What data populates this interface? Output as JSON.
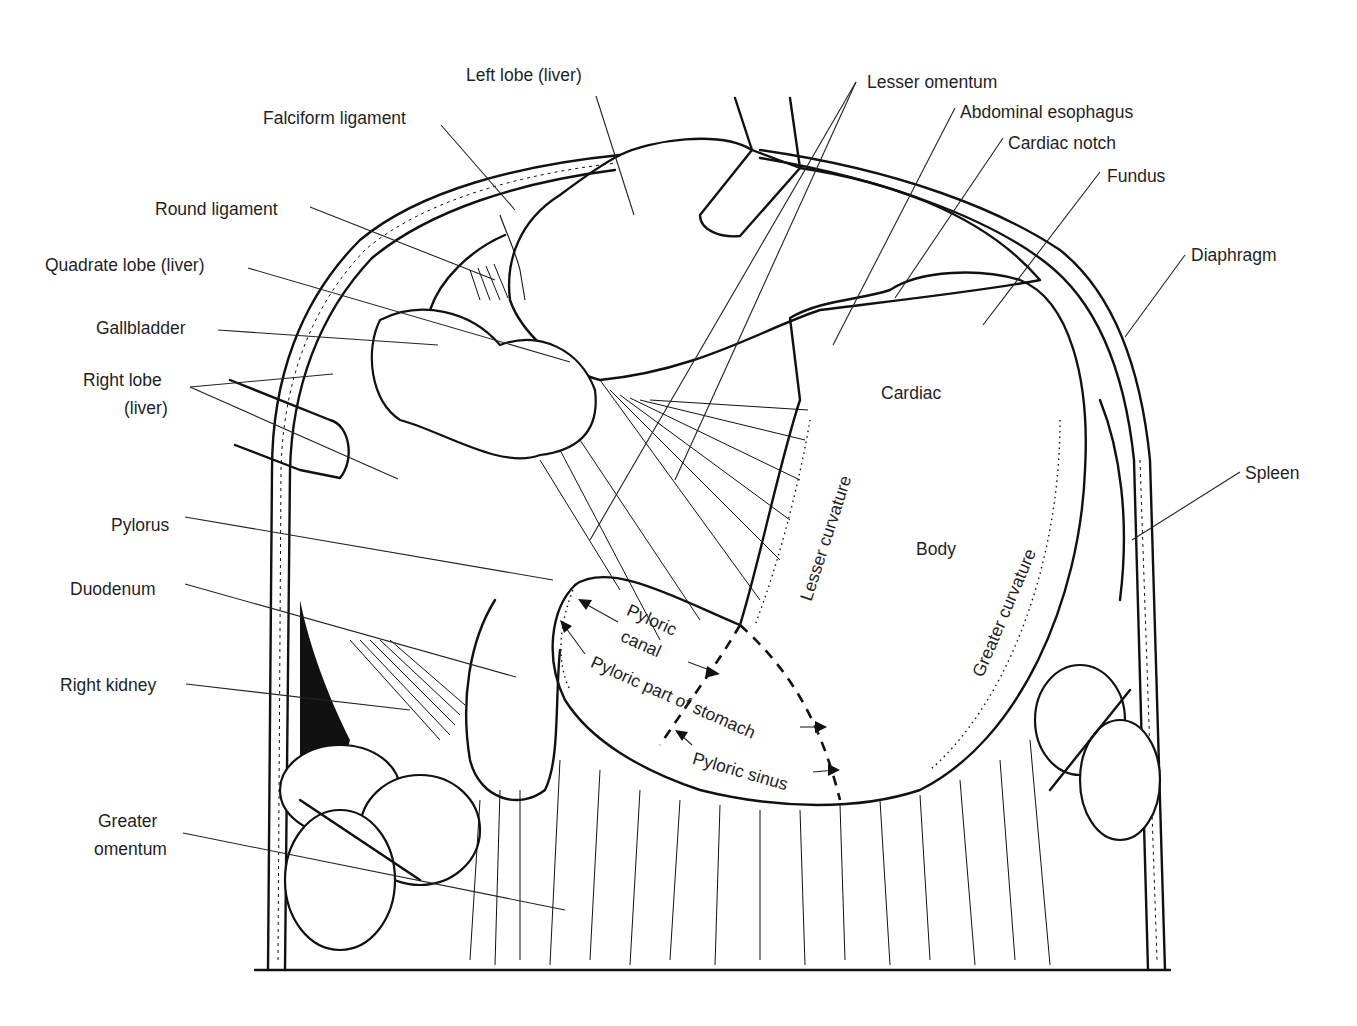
{
  "figure": {
    "labels_left": [
      {
        "id": "falciform",
        "text": "Falciform ligament"
      },
      {
        "id": "round",
        "text": "Round ligament"
      },
      {
        "id": "quadrate",
        "text": "Quadrate lobe (liver)"
      },
      {
        "id": "gallbladder",
        "text": "Gallbladder"
      },
      {
        "id": "right_lobe_1",
        "text": "Right lobe"
      },
      {
        "id": "right_lobe_2",
        "text": "(liver)"
      },
      {
        "id": "pylorus",
        "text": "Pylorus"
      },
      {
        "id": "duodenum",
        "text": "Duodenum"
      },
      {
        "id": "right_kidney",
        "text": "Right kidney"
      },
      {
        "id": "greater_omentum_1",
        "text": "Greater"
      },
      {
        "id": "greater_omentum_2",
        "text": "omentum"
      }
    ],
    "labels_top": [
      {
        "id": "left_lobe",
        "text": "Left lobe (liver)"
      },
      {
        "id": "lesser_omentum",
        "text": "Lesser omentum"
      },
      {
        "id": "abdominal_esophagus",
        "text": "Abdominal esophagus"
      },
      {
        "id": "cardiac_notch",
        "text": "Cardiac notch"
      },
      {
        "id": "fundus",
        "text": "Fundus"
      }
    ],
    "labels_right": [
      {
        "id": "diaphragm",
        "text": "Diaphragm"
      },
      {
        "id": "spleen",
        "text": "Spleen"
      }
    ],
    "labels_inside": {
      "cardiac": "Cardiac",
      "body": "Body",
      "lesser_curvature": "Lesser curvature",
      "greater_curvature": "Greater curvature",
      "pyloric_canal_1": "Pyloric",
      "pyloric_canal_2": "canal",
      "pyloric_part": "Pyloric part of stomach",
      "pyloric_sinus": "Pyloric sinus"
    }
  }
}
